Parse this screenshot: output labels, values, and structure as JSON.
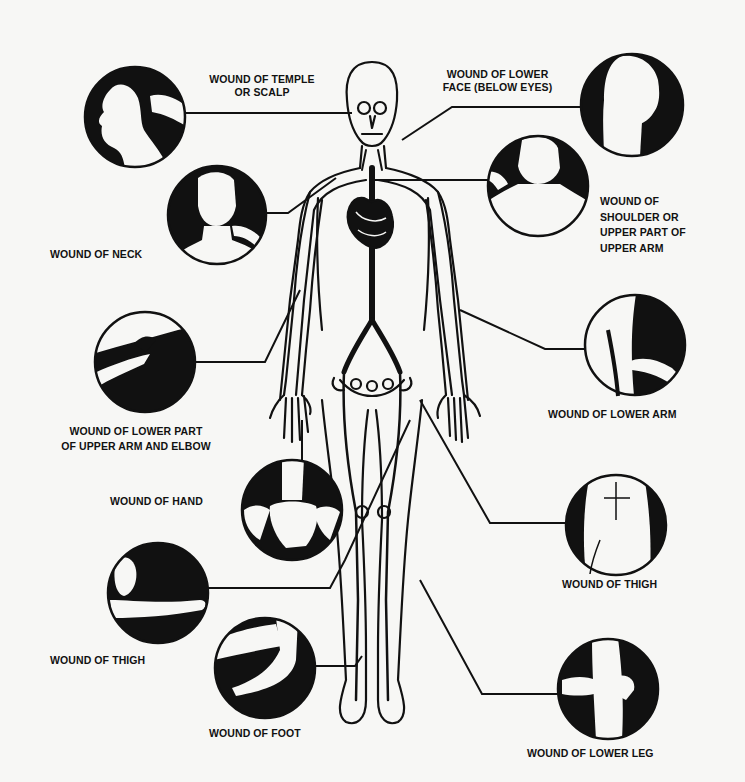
{
  "diagram": {
    "colors": {
      "ink": "#111111",
      "background": "#f7f7f5"
    },
    "labels": {
      "temple": "WOUND OF TEMPLE|OR SCALP",
      "lower_face": "WOUND OF LOWER|FACE (BELOW EYES)",
      "neck": "WOUND OF NECK",
      "shoulder": "WOUND OF|SHOULDER OR|UPPER PART OF|UPPER ARM",
      "elbow": "WOUND OF LOWER PART|OF UPPER ARM AND ELBOW",
      "lower_arm": "WOUND OF LOWER ARM",
      "hand": "WOUND OF HAND",
      "thigh_right": "WOUND OF THIGH",
      "thigh_left": "WOUND OF THIGH",
      "foot": "WOUND OF FOOT",
      "lower_leg": "WOUND OF LOWER LEG"
    },
    "label_lines": {
      "temple_1": "WOUND OF TEMPLE",
      "temple_2": "OR SCALP",
      "lower_face_1": "WOUND OF LOWER",
      "lower_face_2": "FACE (BELOW EYES)",
      "neck_1": "WOUND OF NECK",
      "shoulder_1": "WOUND OF",
      "shoulder_2": "SHOULDER OR",
      "shoulder_3": "UPPER PART OF",
      "shoulder_4": "UPPER ARM",
      "elbow_1": "WOUND OF LOWER PART",
      "elbow_2": "OF UPPER ARM AND ELBOW",
      "lower_arm_1": "WOUND OF LOWER ARM",
      "hand_1": "WOUND OF HAND",
      "thigh_right_1": "WOUND OF THIGH",
      "thigh_left_1": "WOUND OF THIGH",
      "foot_1": "WOUND OF FOOT",
      "lower_leg_1": "WOUND OF LOWER LEG"
    },
    "vignettes": [
      {
        "id": "temple",
        "icon": "head-profile-pressure-icon"
      },
      {
        "id": "neck",
        "icon": "neck-pressure-icon"
      },
      {
        "id": "lower_face",
        "icon": "jaw-pressure-icon"
      },
      {
        "id": "shoulder",
        "icon": "collarbone-pressure-icon"
      },
      {
        "id": "elbow",
        "icon": "upper-arm-pressure-icon"
      },
      {
        "id": "lower_arm",
        "icon": "elbow-crease-pressure-icon"
      },
      {
        "id": "hand",
        "icon": "wrist-pressure-icon"
      },
      {
        "id": "thigh_right",
        "icon": "groin-pressure-icon"
      },
      {
        "id": "thigh_left",
        "icon": "thigh-pressure-icon"
      },
      {
        "id": "foot",
        "icon": "ankle-pressure-icon"
      },
      {
        "id": "lower_leg",
        "icon": "knee-pressure-icon"
      }
    ]
  }
}
